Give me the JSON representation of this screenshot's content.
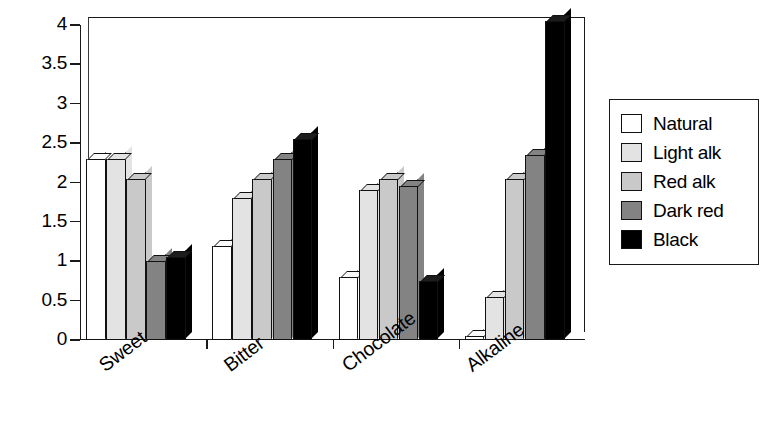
{
  "chart_data": {
    "type": "bar",
    "title": "",
    "xlabel": "",
    "ylabel": "",
    "ylim": [
      0,
      4
    ],
    "grid": false,
    "legend_position": "right",
    "categories": [
      "Sweet",
      "Bitter",
      "Chocolate",
      "Alkaline"
    ],
    "y_ticks": [
      "0",
      "0.5",
      "1",
      "1.5",
      "2",
      "2.5",
      "3",
      "3.5",
      "4"
    ],
    "y_tick_values": [
      0,
      0.5,
      1,
      1.5,
      2,
      2.5,
      3,
      3.5,
      4
    ],
    "series": [
      {
        "name": "Natural",
        "color": "#ffffff",
        "values": [
          2.3,
          1.2,
          0.8,
          0.05
        ]
      },
      {
        "name": "Light alk",
        "color": "#e3e3e3",
        "values": [
          2.3,
          1.8,
          1.9,
          0.55
        ]
      },
      {
        "name": "Red alk",
        "color": "#c9c9c9",
        "values": [
          2.05,
          2.05,
          2.05,
          2.05
        ]
      },
      {
        "name": "Dark red",
        "color": "#838383",
        "values": [
          1.0,
          2.3,
          1.95,
          2.35
        ]
      },
      {
        "name": "Black",
        "color": "#000000",
        "values": [
          1.05,
          2.55,
          0.75,
          4.05
        ]
      }
    ]
  },
  "legend": {
    "items": [
      {
        "label": "Natural"
      },
      {
        "label": "Light alk"
      },
      {
        "label": "Red alk"
      },
      {
        "label": "Dark red"
      },
      {
        "label": "Black"
      }
    ]
  },
  "colors": {
    "axis": "#1a1a1a",
    "natural": "#ffffff",
    "light_alk": "#e3e3e3",
    "red_alk": "#c9c9c9",
    "dark_red": "#838383",
    "black": "#000000",
    "background": "#ffffff"
  }
}
